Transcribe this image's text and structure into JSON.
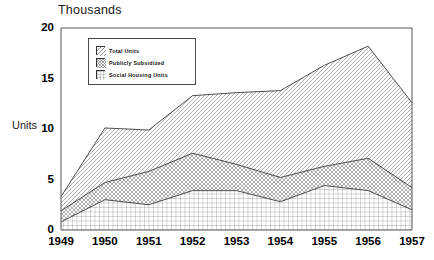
{
  "chart_data": {
    "type": "area",
    "title": "Thousands",
    "xlabel": "",
    "ylabel": "Units",
    "categories": [
      "1949",
      "1950",
      "1951",
      "1952",
      "1953",
      "1954",
      "1955",
      "1956",
      "1957"
    ],
    "x": [
      1949,
      1950,
      1951,
      1952,
      1953,
      1954,
      1955,
      1956,
      1957
    ],
    "ylim": [
      0,
      20
    ],
    "yticks": [
      0,
      5,
      10,
      15,
      20
    ],
    "grid": false,
    "stacked": false,
    "legend_position": "upper-left-inside",
    "series": [
      {
        "name": "Total Units",
        "pattern": "diagonal-hatch",
        "values": [
          3.3,
          10.1,
          9.9,
          13.3,
          13.6,
          13.8,
          16.3,
          18.2,
          12.6
        ]
      },
      {
        "name": "Publicly Subsidized",
        "pattern": "cross-hatch",
        "values": [
          1.9,
          4.7,
          5.8,
          7.6,
          6.5,
          5.2,
          6.3,
          7.1,
          4.2
        ]
      },
      {
        "name": "Social Housing Units",
        "pattern": "fine-grid",
        "values": [
          0.8,
          3.0,
          2.5,
          3.9,
          3.9,
          2.8,
          4.4,
          3.9,
          2.0
        ]
      }
    ]
  },
  "legend": {
    "items": [
      {
        "label": "Total Units"
      },
      {
        "label": "Publicly Subsidized"
      },
      {
        "label": "Social Housing Units"
      }
    ]
  },
  "axes": {
    "y_ticks": [
      "20",
      "15",
      "10",
      "5",
      "0"
    ],
    "y_title": "Units",
    "top_title": "Thousands",
    "x_ticks": [
      "1949",
      "1950",
      "1951",
      "1952",
      "1953",
      "1954",
      "1955",
      "1956",
      "1957"
    ]
  },
  "colors": {
    "axis": "#555555",
    "line": "#3a3a3a",
    "text": "#000000",
    "background": "#ffffff"
  }
}
